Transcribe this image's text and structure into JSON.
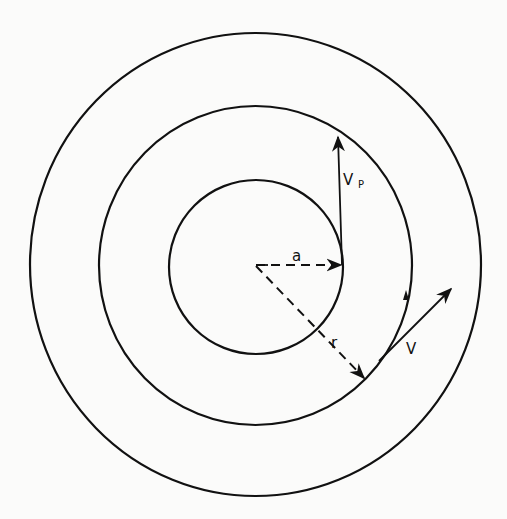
{
  "figure": {
    "stroke_color": "#111111",
    "background_color": "#fbfbfa"
  },
  "circles": [
    {
      "name": "inner-circle",
      "role": "radius a"
    },
    {
      "name": "middle-circle",
      "role": "radius r (orbit path)"
    },
    {
      "name": "outer-circle",
      "role": "outer boundary"
    }
  ],
  "labels": {
    "radius_a": "a",
    "radius_r": "r",
    "velocity_p_main": "V",
    "velocity_p_sub": "P",
    "velocity": "V"
  },
  "vectors": [
    {
      "name": "vp-vector",
      "label": "Vp",
      "style": "solid arrow",
      "direction": "up, tangent to inner circle"
    },
    {
      "name": "v-vector",
      "label": "V",
      "style": "solid arrow",
      "direction": "up-right, tangent to middle circle"
    },
    {
      "name": "a-radius",
      "label": "a",
      "style": "dashed arrow",
      "direction": "center to inner circle"
    },
    {
      "name": "r-radius",
      "label": "r",
      "style": "dashed arrow",
      "direction": "center to middle circle"
    }
  ]
}
